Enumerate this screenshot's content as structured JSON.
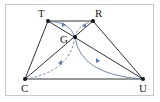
{
  "diagram": {
    "points": [
      {
        "name": "T",
        "x": 48,
        "y": 21
      },
      {
        "name": "R",
        "x": 93,
        "y": 21
      },
      {
        "name": "G",
        "x": 75,
        "y": 37
      },
      {
        "name": "C",
        "x": 25,
        "y": 79
      },
      {
        "name": "U",
        "x": 143,
        "y": 79
      }
    ],
    "labels": {
      "T": "T",
      "R": "R",
      "G": "G",
      "C": "C",
      "U": "U"
    },
    "colors": {
      "edge": "#333333",
      "curve": "#5a7db8",
      "frame": "#c8c8c8"
    }
  }
}
